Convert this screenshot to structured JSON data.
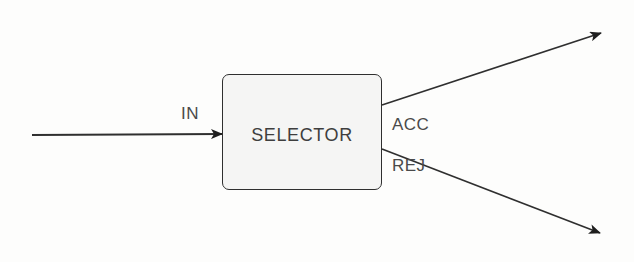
{
  "diagram": {
    "block": {
      "label": "SELECTOR"
    },
    "ports": {
      "input": "IN",
      "accept": "ACC",
      "reject": "REJ"
    },
    "colors": {
      "line": "#2f2f2f",
      "text": "#4a4a4a",
      "block_fill": "#f5f5f4",
      "background": "#fdfdfc"
    }
  }
}
